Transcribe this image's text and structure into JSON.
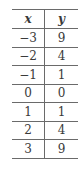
{
  "table": {
    "headers": [
      "x",
      "y"
    ],
    "rows": [
      [
        "−3",
        "9"
      ],
      [
        "−2",
        "4"
      ],
      [
        "−1",
        "1"
      ],
      [
        "0",
        "0"
      ],
      [
        "1",
        "1"
      ],
      [
        "2",
        "4"
      ],
      [
        "3",
        "9"
      ]
    ]
  }
}
